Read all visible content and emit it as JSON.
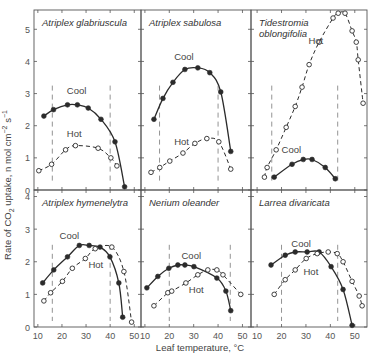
{
  "chart_data": {
    "type": "line",
    "title": "",
    "xlabel": "Leaf temperature, °C",
    "ylabel": "Rate of CO2 uptake, n mol cm-2 s-1",
    "grid": false,
    "layout": {
      "rows": 2,
      "cols": 3
    },
    "x_ticks": [
      10,
      20,
      30,
      40,
      50
    ],
    "panels": [
      {
        "title": "Atriplex glabriuscula",
        "row": 0,
        "col": 0,
        "ylim": [
          0,
          5.6
        ],
        "y_ticks": [
          0,
          1,
          2,
          3,
          4,
          5
        ],
        "xlim": [
          8.4,
          52.8
        ],
        "dashed_verticals": [
          16,
          40
        ],
        "series": [
          {
            "name": "Cool",
            "style": "solid-filled",
            "x": [
              12.5,
              16.5,
              22.3,
              26.4,
              30.9,
              36.2,
              42.0,
              46.0
            ],
            "y": [
              2.3,
              2.5,
              2.65,
              2.65,
              2.55,
              2.2,
              1.5,
              0.1
            ],
            "label_pos": [
              22,
              3.0
            ]
          },
          {
            "name": "Hot",
            "style": "dashed-open",
            "x": [
              10.4,
              15.7,
              21.5,
              25.6,
              35.0,
              40.3,
              42.8
            ],
            "y": [
              0.6,
              0.8,
              1.25,
              1.38,
              1.3,
              1.0,
              0.75
            ],
            "label_pos": [
              22,
              1.65
            ]
          }
        ]
      },
      {
        "title": "Atriplex sabulosa",
        "row": 0,
        "col": 1,
        "ylim": [
          0,
          5.6
        ],
        "y_ticks": [
          0,
          1,
          2,
          3,
          4,
          5
        ],
        "xlim": [
          8.4,
          53.5
        ],
        "dashed_verticals": [
          16,
          40
        ],
        "series": [
          {
            "name": "Cool",
            "style": "solid-filled",
            "x": [
              13.7,
              17.4,
              21.5,
              26.4,
              31.7,
              36.6,
              41.1,
              45.2
            ],
            "y": [
              2.2,
              2.85,
              3.35,
              3.75,
              3.8,
              3.65,
              3.05,
              1.2
            ],
            "label_pos": [
              22,
              4.05
            ]
          },
          {
            "name": "Hot",
            "style": "dashed-open",
            "x": [
              12.5,
              16.1,
              20.2,
              25.6,
              30.5,
              35.4,
              40.3,
              45.2
            ],
            "y": [
              0.55,
              0.7,
              0.9,
              1.15,
              1.45,
              1.6,
              1.5,
              0.65
            ],
            "label_pos": [
              22,
              1.4
            ]
          }
        ]
      },
      {
        "title": "Tidestromia oblongifolia",
        "title_lines": [
          "Tidestromia",
          "oblongifolia"
        ],
        "row": 0,
        "col": 2,
        "ylim": [
          0,
          5.6
        ],
        "y_ticks": [
          0,
          1,
          2,
          3,
          4,
          5
        ],
        "xlim": [
          7.5,
          55.0
        ],
        "dashed_verticals": [
          16,
          43
        ],
        "series": [
          {
            "name": "Cool",
            "style": "solid-filled",
            "x": [
              17.0,
              24.3,
              28.9,
              32.5,
              37.9,
              42.0
            ],
            "y": [
              0.4,
              0.8,
              0.95,
              0.95,
              0.7,
              0.35
            ],
            "label_pos": [
              20,
              1.15
            ]
          },
          {
            "name": "Hot",
            "style": "dashed-open",
            "x": [
              13.0,
              14.1,
              17.8,
              21.9,
              25.6,
              28.4,
              31.3,
              35.4,
              41.1,
              43.2,
              46.0,
              48.9,
              50.6,
              51.4,
              53.4
            ],
            "y": [
              0.4,
              0.7,
              1.25,
              1.95,
              2.6,
              3.2,
              3.9,
              4.6,
              5.35,
              5.5,
              5.5,
              4.95,
              4.6,
              4.05,
              2.7
            ],
            "label_pos": [
              31,
              4.55
            ]
          }
        ]
      },
      {
        "title": "Atriplex hymenelytra",
        "row": 1,
        "col": 0,
        "ylim": [
          0,
          4.2
        ],
        "y_ticks": [
          0,
          1,
          2,
          3,
          4
        ],
        "xlim": [
          8.4,
          52.8
        ],
        "dashed_verticals": [
          16,
          40
        ],
        "series": [
          {
            "name": "Cool",
            "style": "solid-filled",
            "x": [
              12.0,
              16.6,
              22.3,
              27.2,
              31.3,
              35.8,
              39.9,
              43.6,
              45.2
            ],
            "y": [
              1.35,
              1.75,
              2.15,
              2.5,
              2.5,
              2.45,
              2.15,
              1.35,
              0.3
            ],
            "label_pos": [
              19,
              2.7
            ]
          },
          {
            "name": "Hot",
            "style": "dashed-open",
            "x": [
              12.5,
              15.3,
              20.2,
              24.3,
              29.7,
              33.8,
              40.7,
              45.7,
              48.9
            ],
            "y": [
              0.8,
              1.05,
              1.4,
              1.8,
              2.1,
              2.4,
              2.45,
              1.7,
              0.15
            ],
            "label_pos": [
              31,
              1.8
            ]
          }
        ]
      },
      {
        "title": "Nerium oleander",
        "row": 1,
        "col": 1,
        "ylim": [
          0,
          4.2
        ],
        "y_ticks": [
          0,
          1,
          2,
          3,
          4
        ],
        "xlim": [
          8.4,
          53.5
        ],
        "dashed_verticals": [
          20,
          45
        ],
        "series": [
          {
            "name": "Cool",
            "style": "solid-filled",
            "x": [
              10.8,
              15.3,
              19.8,
              23.5,
              26.4,
              30.1,
              39.5,
              43.2,
              45.2
            ],
            "y": [
              1.2,
              1.55,
              1.8,
              1.9,
              1.9,
              1.85,
              1.5,
              1.1,
              0.5
            ],
            "label_pos": [
              25,
              2.1
            ]
          },
          {
            "name": "Hot",
            "style": "dashed-open",
            "x": [
              13.7,
              19.4,
              21.0,
              26.8,
              31.7,
              35.8,
              39.5,
              42.0,
              49.3
            ],
            "y": [
              0.65,
              1.05,
              1.1,
              1.35,
              1.6,
              1.75,
              1.75,
              1.6,
              1.0
            ],
            "label_pos": [
              28,
              1.05
            ]
          }
        ]
      },
      {
        "title": "Larrea divaricata",
        "row": 1,
        "col": 2,
        "ylim": [
          0,
          4.2
        ],
        "y_ticks": [
          0,
          1,
          2,
          3,
          4
        ],
        "xlim": [
          7.5,
          55.0
        ],
        "dashed_verticals": [
          20,
          43
        ],
        "series": [
          {
            "name": "Cool",
            "style": "solid-filled",
            "x": [
              15.7,
              21.5,
              25.6,
              30.5,
              35.4,
              40.3,
              45.2,
              48.9
            ],
            "y": [
              1.9,
              2.2,
              2.3,
              2.3,
              2.3,
              1.85,
              1.15,
              0.05
            ],
            "label_pos": [
              24,
              2.45
            ]
          },
          {
            "name": "Hot",
            "style": "dashed-open",
            "x": [
              17.0,
              21.5,
              25.6,
              30.1,
              34.6,
              39.1,
              42.8,
              45.2,
              48.9,
              51.8,
              53.0
            ],
            "y": [
              1.0,
              1.45,
              1.75,
              2.1,
              2.25,
              2.3,
              2.25,
              2.0,
              1.4,
              0.95,
              0.65
            ],
            "label_pos": [
              29,
              1.6
            ]
          }
        ]
      }
    ]
  },
  "figure": {
    "xlabel": "Leaf temperature, °C",
    "ylabel_main": "Rate of CO",
    "ylabel_sub": "2",
    "ylabel_rest": " uptake, n mol cm",
    "ylabel_sup1": "−2",
    "ylabel_mid": " s",
    "ylabel_sup2": "−1",
    "series_labels": {
      "cool": "Cool",
      "hot": "Hot"
    },
    "colors": {
      "ink": "#2b2b2b",
      "axis": "#555555",
      "dashed": "#777777",
      "background": "#ffffff"
    }
  }
}
